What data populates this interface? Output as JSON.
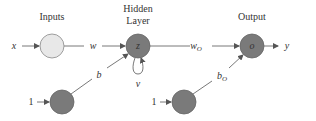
{
  "diagram": {
    "headers": {
      "inputs": "Inputs",
      "hidden_line1": "Hidden",
      "hidden_line2": "Layer",
      "output": "Output"
    },
    "nodes": {
      "input": {
        "label": "",
        "fill": "#e8e8e8"
      },
      "hidden": {
        "label": "z",
        "fill": "#7a7a7a"
      },
      "output": {
        "label": "o",
        "fill": "#7a7a7a"
      },
      "bias_hidden": {
        "label": "",
        "fill": "#7a7a7a"
      },
      "bias_output": {
        "label": "",
        "fill": "#7a7a7a"
      }
    },
    "edge_labels": {
      "x_in": "x",
      "w": "w",
      "w_o_main": "w",
      "w_o_sub": "O",
      "y_out": "y",
      "b": "b",
      "b_o_main": "b",
      "b_o_sub": "O",
      "v": "v",
      "bias1_in": "1",
      "bias2_in": "1"
    }
  }
}
